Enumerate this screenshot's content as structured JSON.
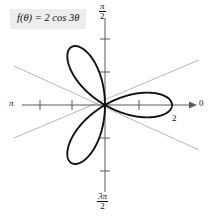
{
  "figure": {
    "background_color": "#ffffff",
    "curve_color": "#111111",
    "axis_color": "#5a5a5a",
    "guide_line_color": "#b8b8b8",
    "equation_box_color": "#ededed"
  },
  "equation": {
    "text": "f(θ) = 2 cos 3θ"
  },
  "labels": {
    "right_axis": "0",
    "left_axis": "π",
    "top_axis_num": "π",
    "top_axis_den": "2",
    "bottom_axis_num": "3π",
    "bottom_axis_den": "2",
    "radius_tick": "2"
  },
  "chart_data": {
    "type": "line",
    "subtype": "polar-rose",
    "title": "f(θ) = 2 cos 3θ",
    "equation": "r = 2 cos(3θ)",
    "xlabel": "",
    "ylabel": "",
    "coordinate_system": "polar",
    "grid": false,
    "legend": null,
    "amplitude": 2,
    "petal_count": 3,
    "petal_angles_deg": [
      0,
      120,
      240
    ],
    "angle_tick_labels": {
      "0": "0",
      "90": "π/2",
      "180": "π",
      "270": "3π/2"
    },
    "radial_ticks": [
      1,
      2
    ],
    "radial_tick_labels": [
      "",
      "2"
    ],
    "rlim": [
      0,
      2
    ],
    "guide_lines_deg": [
      30,
      150,
      210,
      330
    ],
    "annotations": [
      {
        "text": "2",
        "r": 2,
        "theta_deg": 0,
        "note": "petal tip radius on polar axis"
      }
    ],
    "series": [
      {
        "name": "r = 2 cos 3θ",
        "theta_deg": [
          0,
          5,
          10,
          15,
          20,
          25,
          30,
          35,
          40,
          45,
          50,
          55,
          60,
          65,
          70,
          75,
          80,
          85,
          90,
          95,
          100,
          105,
          110,
          115,
          120,
          125,
          130,
          135,
          140,
          145,
          150,
          155,
          160,
          165,
          170,
          175,
          180
        ],
        "r": [
          2.0,
          1.93,
          1.73,
          1.41,
          1.0,
          0.52,
          0.0,
          -0.52,
          -1.0,
          -1.41,
          -1.73,
          -1.93,
          -2.0,
          -1.93,
          -1.73,
          -1.41,
          -1.0,
          -0.52,
          0.0,
          0.52,
          1.0,
          1.41,
          1.73,
          1.93,
          2.0,
          1.93,
          1.73,
          1.41,
          1.0,
          0.52,
          0.0,
          -0.52,
          -1.0,
          -1.41,
          -1.73,
          -1.93,
          -2.0
        ]
      }
    ]
  }
}
